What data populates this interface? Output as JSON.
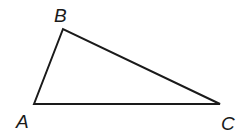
{
  "diagram": {
    "type": "triangle",
    "stroke_color": "#1a1a1a",
    "vertices": [
      {
        "label": "A",
        "x": 34,
        "y": 104,
        "label_x": 16,
        "label_y": 128
      },
      {
        "label": "B",
        "x": 63,
        "y": 29,
        "label_x": 54,
        "label_y": 22
      },
      {
        "label": "C",
        "x": 220,
        "y": 104,
        "label_x": 221,
        "label_y": 130
      }
    ]
  }
}
